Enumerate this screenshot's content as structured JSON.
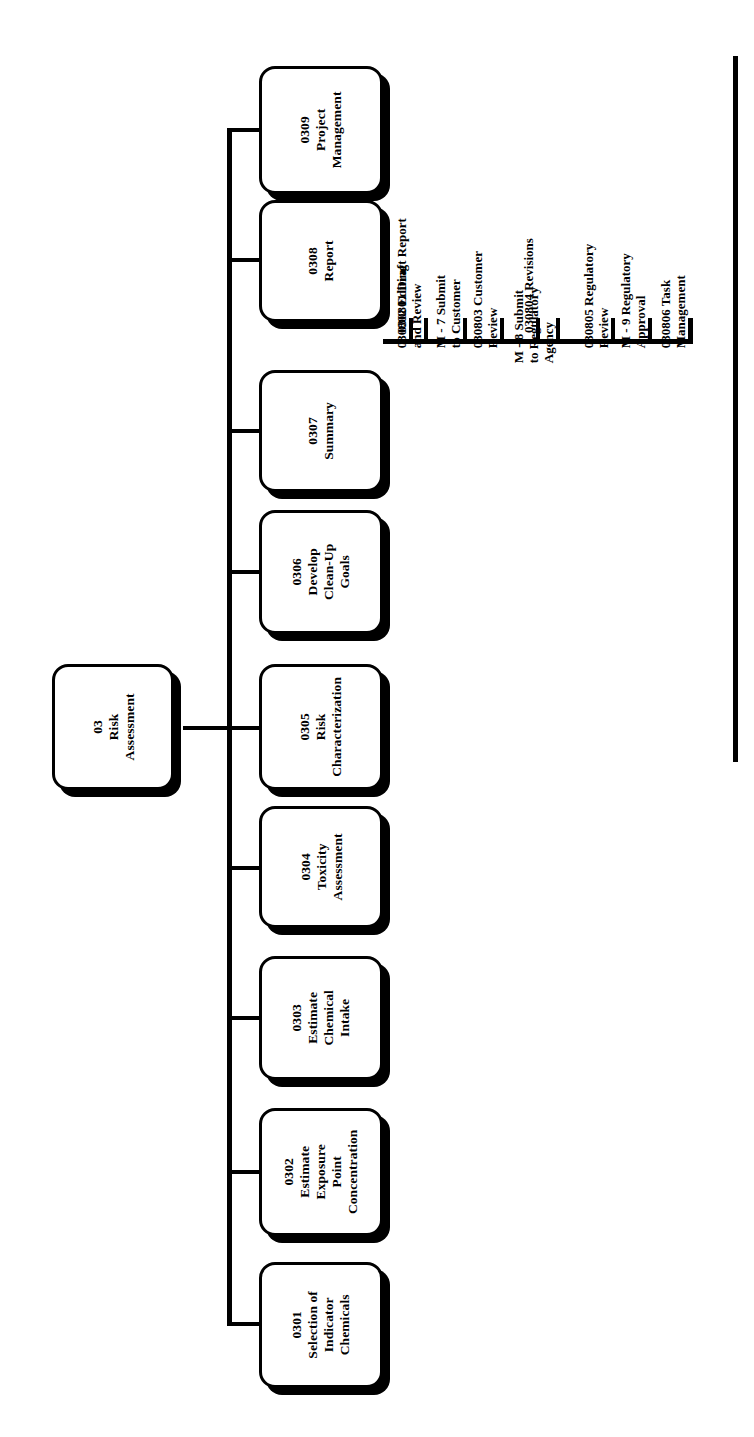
{
  "diagram": {
    "orientation": "rotated-90",
    "root": {
      "code": "03",
      "name_lines": [
        "03",
        "Risk",
        "Assessment"
      ]
    },
    "children": [
      {
        "code": "0301",
        "name_lines": [
          "0301",
          "Selection of",
          "Indicator",
          "Chemicals"
        ]
      },
      {
        "code": "0302",
        "name_lines": [
          "0302",
          "Estimate",
          "Exposure",
          "Point",
          "Concentration"
        ]
      },
      {
        "code": "0303",
        "name_lines": [
          "0303",
          "Estimate",
          "Chemical",
          "Intake"
        ]
      },
      {
        "code": "0304",
        "name_lines": [
          "0304",
          "Toxicity",
          "Assessment"
        ]
      },
      {
        "code": "0305",
        "name_lines": [
          "0305",
          "Risk",
          "Characterization"
        ]
      },
      {
        "code": "0306",
        "name_lines": [
          "0306",
          "Develop",
          "Clean-Up",
          "Goals"
        ]
      },
      {
        "code": "0307",
        "name_lines": [
          "0307",
          "Summary"
        ]
      },
      {
        "code": "0308",
        "name_lines": [
          "0308",
          "Report"
        ]
      },
      {
        "code": "0309",
        "name_lines": [
          "0309",
          "Project",
          "Management"
        ]
      }
    ],
    "subtasks_parent": "0308",
    "subtasks": [
      {
        "id": "030801",
        "lines": [
          "030801 Draft Report"
        ]
      },
      {
        "id": "030802",
        "lines": [
          "030802 Editing",
          "and Review"
        ]
      },
      {
        "id": "M-7",
        "lines": [
          "M - 7 Submit",
          "to Customer"
        ]
      },
      {
        "id": "030803",
        "lines": [
          "030803 Customer",
          "Review"
        ]
      },
      {
        "id": "030804",
        "lines": [
          "030804 Revisions"
        ]
      },
      {
        "id": "M-8",
        "lines": [
          "M - 8 Submit",
          "to Regulatory",
          "Agency"
        ]
      },
      {
        "id": "030805",
        "lines": [
          "030805 Regulatory",
          "Review"
        ]
      },
      {
        "id": "M-9",
        "lines": [
          "M - 9 Regulatory",
          "Approval"
        ]
      },
      {
        "id": "030806",
        "lines": [
          "030806 Task",
          "Management"
        ]
      }
    ],
    "colors": {
      "ink": "#000000",
      "paper": "#ffffff"
    }
  }
}
